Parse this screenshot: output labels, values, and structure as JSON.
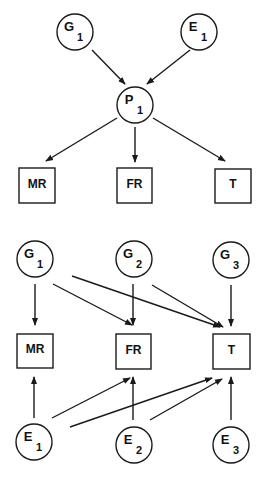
{
  "diagrams": [
    {
      "id": "top",
      "nodes": [
        {
          "key": "G1",
          "shape": "circle",
          "letter": "G",
          "sub": "1",
          "cx": 75,
          "cy": 32,
          "r": 18
        },
        {
          "key": "E1",
          "shape": "circle",
          "letter": "E",
          "sub": "1",
          "cx": 199,
          "cy": 32,
          "r": 18
        },
        {
          "key": "P1",
          "shape": "circle",
          "letter": "P",
          "sub": "1",
          "cx": 135,
          "cy": 105,
          "r": 18
        },
        {
          "key": "MR",
          "shape": "box",
          "label": "MR",
          "x": 19,
          "y": 168,
          "w": 36,
          "h": 35
        },
        {
          "key": "FR",
          "shape": "box",
          "label": "FR",
          "x": 117,
          "y": 168,
          "w": 35,
          "h": 35
        },
        {
          "key": "T",
          "shape": "box",
          "label": "T",
          "x": 215,
          "y": 169,
          "w": 36,
          "h": 34
        }
      ],
      "edges": [
        {
          "from": "G1",
          "to": "P1",
          "x1": 92,
          "y1": 50,
          "x2": 125,
          "y2": 84
        },
        {
          "from": "E1",
          "to": "P1",
          "x1": 190,
          "y1": 50,
          "x2": 147,
          "y2": 84
        },
        {
          "from": "P1",
          "to": "MR",
          "x1": 117,
          "y1": 118,
          "x2": 46,
          "y2": 161
        },
        {
          "from": "P1",
          "to": "FR",
          "x1": 135,
          "y1": 127,
          "x2": 135,
          "y2": 162
        },
        {
          "from": "P1",
          "to": "T",
          "x1": 153,
          "y1": 118,
          "x2": 225,
          "y2": 161
        }
      ]
    },
    {
      "id": "bottom",
      "nodes": [
        {
          "key": "G1",
          "shape": "circle",
          "letter": "G",
          "sub": "1",
          "cx": 35,
          "cy": 259,
          "r": 18
        },
        {
          "key": "G2",
          "shape": "circle",
          "letter": "G",
          "sub": "2",
          "cx": 134,
          "cy": 259,
          "r": 18
        },
        {
          "key": "G3",
          "shape": "circle",
          "letter": "G",
          "sub": "3",
          "cx": 231,
          "cy": 260,
          "r": 18
        },
        {
          "key": "MR",
          "shape": "box",
          "label": "MR",
          "x": 17,
          "y": 334,
          "w": 36,
          "h": 34
        },
        {
          "key": "FR",
          "shape": "box",
          "label": "FR",
          "x": 116,
          "y": 334,
          "w": 35,
          "h": 35
        },
        {
          "key": "T",
          "shape": "box",
          "label": "T",
          "x": 213,
          "y": 334,
          "w": 37,
          "h": 35
        },
        {
          "key": "E1",
          "shape": "circle",
          "letter": "E",
          "sub": "1",
          "cx": 34,
          "cy": 442,
          "r": 18
        },
        {
          "key": "E2",
          "shape": "circle",
          "letter": "E",
          "sub": "2",
          "cx": 134,
          "cy": 445,
          "r": 18
        },
        {
          "key": "E3",
          "shape": "circle",
          "letter": "E",
          "sub": "3",
          "cx": 231,
          "cy": 445,
          "r": 18
        }
      ],
      "edges": [
        {
          "from": "G1",
          "to": "MR",
          "x1": 35,
          "y1": 284,
          "x2": 35,
          "y2": 325
        },
        {
          "from": "G1",
          "to": "FR",
          "x1": 53,
          "y1": 284,
          "x2": 132,
          "y2": 325
        },
        {
          "from": "G1",
          "to": "T",
          "x1": 72,
          "y1": 276,
          "x2": 220,
          "y2": 327
        },
        {
          "from": "G2",
          "to": "FR",
          "x1": 133,
          "y1": 284,
          "x2": 133,
          "y2": 325
        },
        {
          "from": "G2",
          "to": "T",
          "x1": 152,
          "y1": 285,
          "x2": 223,
          "y2": 327
        },
        {
          "from": "G3",
          "to": "T",
          "x1": 231,
          "y1": 285,
          "x2": 231,
          "y2": 326
        },
        {
          "from": "E1",
          "to": "MR",
          "x1": 34,
          "y1": 418,
          "x2": 34,
          "y2": 377
        },
        {
          "from": "E1",
          "to": "FR",
          "x1": 52,
          "y1": 418,
          "x2": 130,
          "y2": 378
        },
        {
          "from": "E1",
          "to": "T",
          "x1": 70,
          "y1": 427,
          "x2": 212,
          "y2": 378
        },
        {
          "from": "E2",
          "to": "FR",
          "x1": 133,
          "y1": 420,
          "x2": 133,
          "y2": 377
        },
        {
          "from": "E2",
          "to": "T",
          "x1": 150,
          "y1": 420,
          "x2": 222,
          "y2": 379
        },
        {
          "from": "E3",
          "to": "T",
          "x1": 231,
          "y1": 420,
          "x2": 231,
          "y2": 377
        }
      ]
    }
  ],
  "style": {
    "stroke": "#1a1a1a",
    "background": "#ffffff"
  }
}
